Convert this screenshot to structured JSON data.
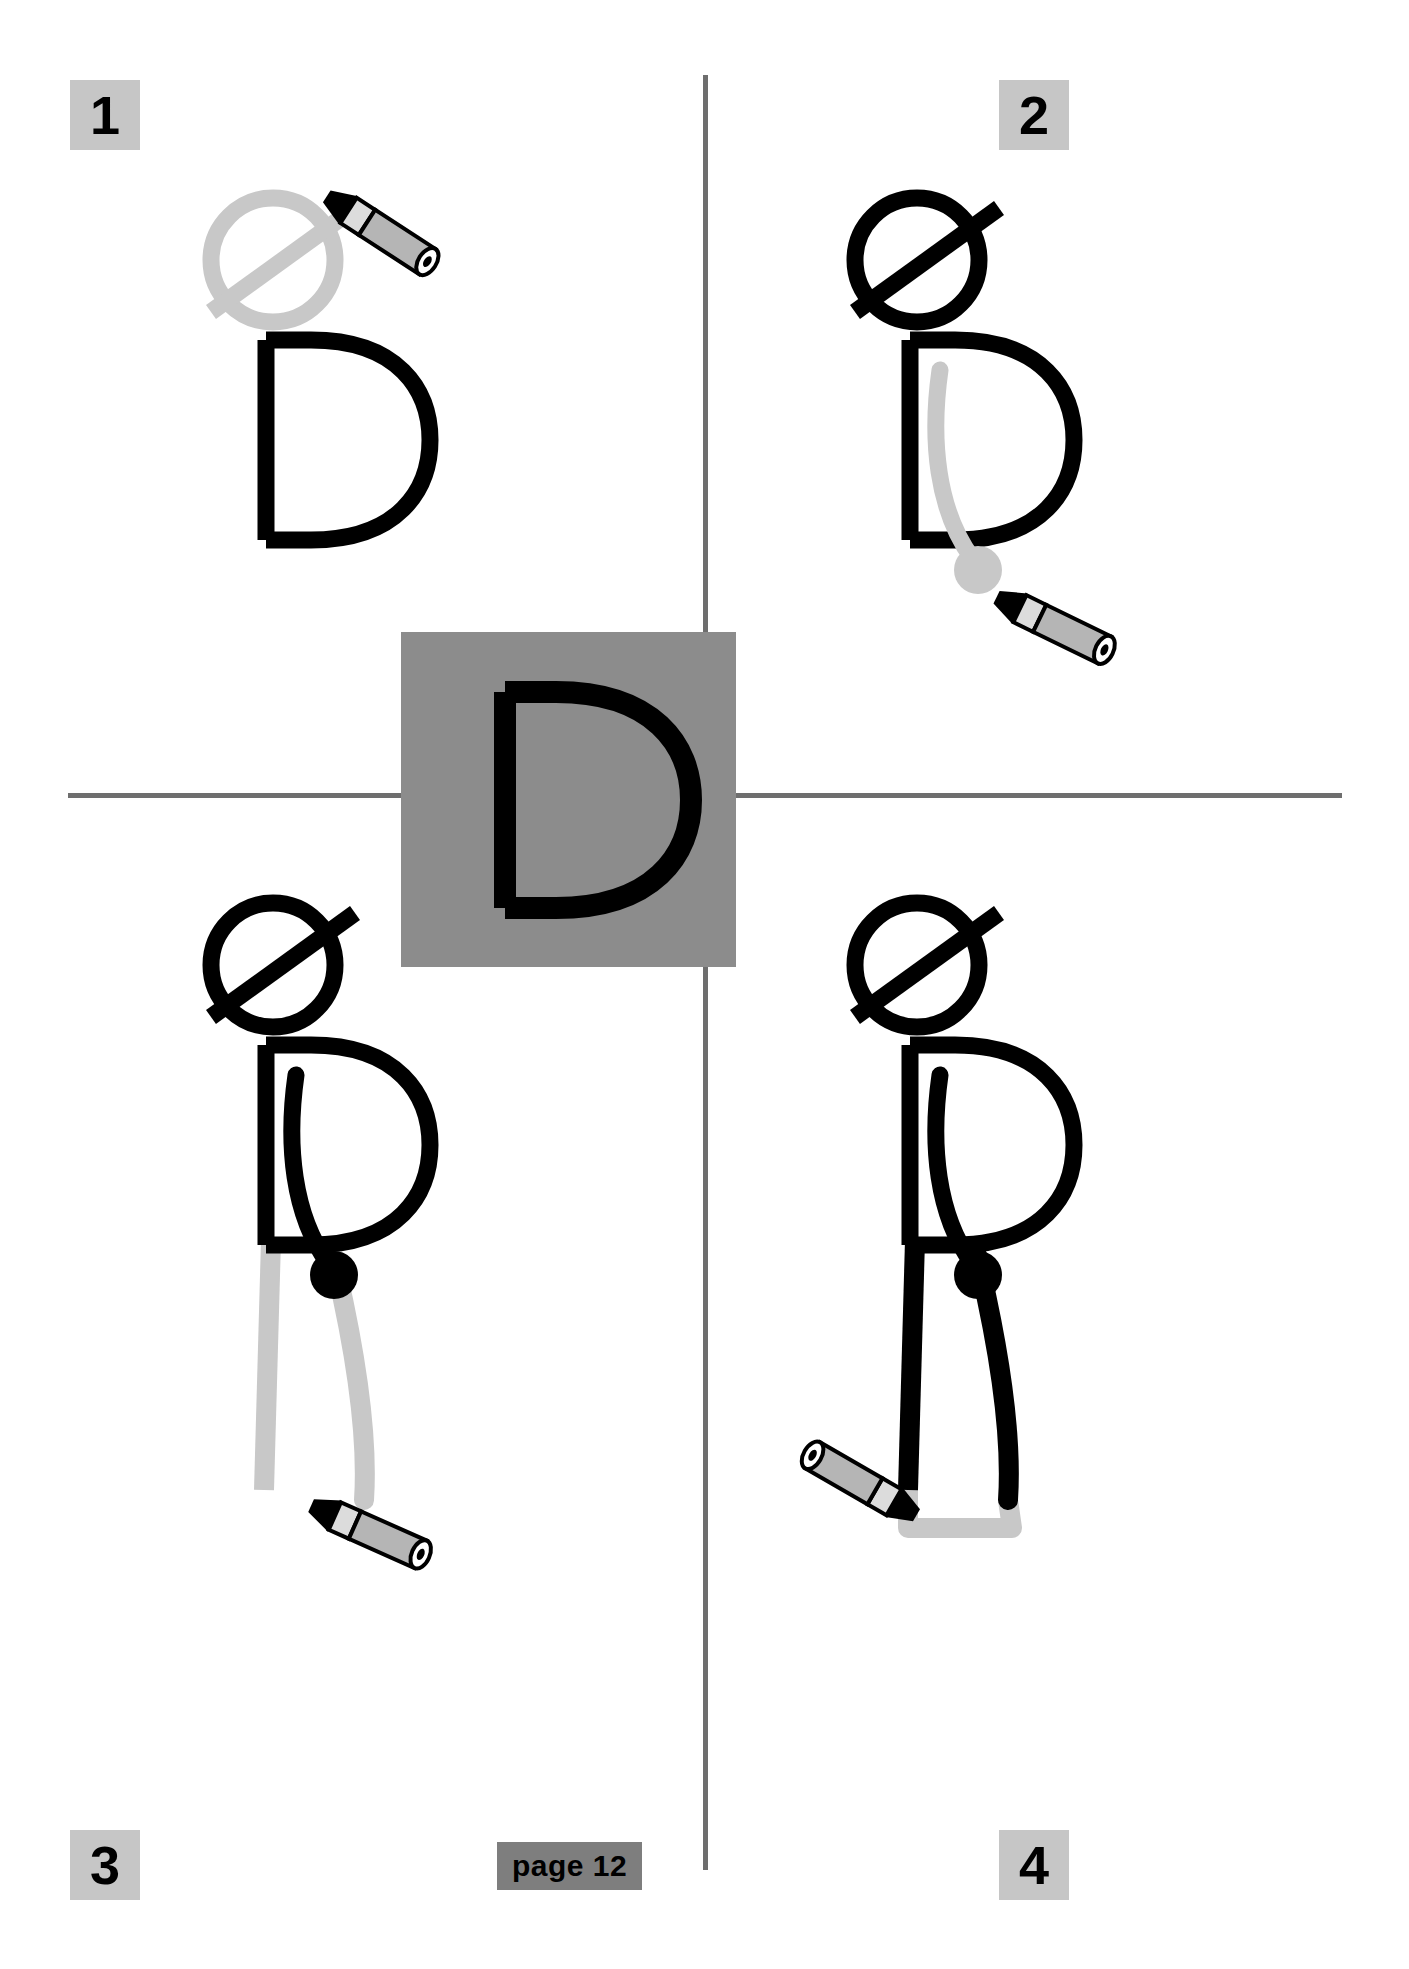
{
  "document": {
    "kind": "letter-drawing-worksheet",
    "letter": "D",
    "page_label": "page 12"
  },
  "colors": {
    "ink_black": "#000000",
    "ghost_gray": "#c8c8c8",
    "panel_gray": "#8c8c8c",
    "badge_gray": "#c6c6c6",
    "footer_gray": "#7e7e7e",
    "divider_gray": "#6e6e6e",
    "pencil_body": "#b5b5b5",
    "pencil_tip": "#d9d9d9",
    "paper_white": "#ffffff"
  },
  "steps": [
    {
      "number": "1",
      "name": "draw-head",
      "badge_position": "top-left",
      "new_stroke": "head-circle-with-hat-brim",
      "letter_visible": true
    },
    {
      "number": "2",
      "name": "draw-arm",
      "badge_position": "top-right",
      "new_stroke": "arm-with-hand",
      "letter_visible": true
    },
    {
      "number": "3",
      "name": "draw-leg",
      "badge_position": "bottom-left",
      "new_stroke": "front-leg",
      "letter_visible": true
    },
    {
      "number": "4",
      "name": "draw-foot",
      "badge_position": "bottom-right",
      "new_stroke": "back-leg-and-foot",
      "letter_visible": true
    }
  ],
  "center_panel": {
    "name": "reference-letter-panel",
    "letter": "D",
    "background": "#8c8c8c",
    "letter_color": "#000000"
  },
  "icons": {
    "pencil": "pencil-icon",
    "head": "head-circle-icon",
    "hat_brim": "hat-brim-icon",
    "arm": "arm-stroke-icon",
    "hand": "hand-dot-icon",
    "leg": "leg-stroke-icon",
    "foot": "foot-stroke-icon",
    "letter_d": "letter-d-icon"
  },
  "badges": {
    "one": "1",
    "two": "2",
    "three": "3",
    "four": "4"
  },
  "footer": {
    "page_text": "page 12"
  }
}
